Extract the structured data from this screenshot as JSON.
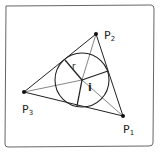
{
  "diagram": {
    "points": [
      {
        "id": "P1",
        "label": "P",
        "sub": "1",
        "x": 123,
        "y": 116
      },
      {
        "id": "P2",
        "label": "P",
        "sub": "2",
        "x": 96,
        "y": 34
      },
      {
        "id": "P3",
        "label": "P",
        "sub": "3",
        "x": 24,
        "y": 92
      }
    ],
    "incenter": {
      "label": "i",
      "x": 82,
      "y": 80
    },
    "radius_label": "r",
    "radius": 27,
    "colors": {
      "stroke": "#222222",
      "frame": "#555555",
      "background": "#ffffff"
    }
  }
}
